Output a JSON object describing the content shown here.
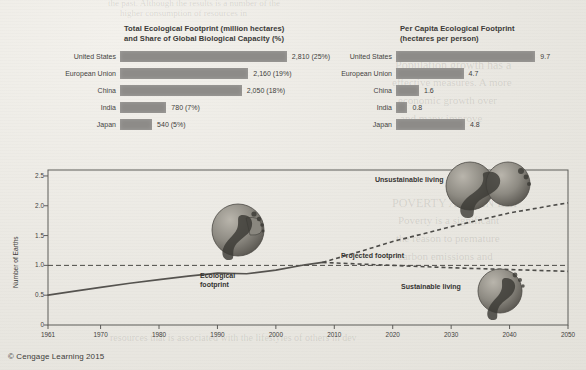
{
  "copyright": "© Cengage Learning 2015",
  "background_bleed": [
    {
      "text": "the past. Although the results is a number of the",
      "x": 108,
      "y": -2,
      "size": 9
    },
    {
      "text": "higher consumption of resources in",
      "x": 120,
      "y": 8,
      "size": 9
    },
    {
      "text": "Population growth has a",
      "x": 395,
      "y": 58,
      "size": 12
    },
    {
      "text": "effective measures. A more",
      "x": 392,
      "y": 76,
      "size": 11
    },
    {
      "text": "economic growth over",
      "x": 398,
      "y": 94,
      "size": 11
    },
    {
      "text": "and many improve",
      "x": 400,
      "y": 112,
      "size": 11
    },
    {
      "text": "POVERTY AND AN EXP",
      "x": 392,
      "y": 196,
      "size": 12
    },
    {
      "text": "Poverty is a significant",
      "x": 398,
      "y": 214,
      "size": 11
    },
    {
      "text": "the reason to premature",
      "x": 396,
      "y": 232,
      "size": 11
    },
    {
      "text": "carbon emissions and",
      "x": 398,
      "y": 250,
      "size": 11
    },
    {
      "text": "resources that is associated with the lifestyles of others in dev",
      "x": 110,
      "y": 332,
      "size": 10
    }
  ],
  "left_chart": {
    "title_line1": "Total Ecological Footprint (million hectares)",
    "title_line2": "and Share of Global Biological Capacity (%)",
    "chart_data": {
      "type": "bar",
      "title": "Total Ecological Footprint (million hectares) and Share of Global Biological Capacity (%)",
      "xlabel": "",
      "ylabel": "",
      "orientation": "horizontal",
      "categories": [
        "United States",
        "European Union",
        "China",
        "India",
        "Japan"
      ],
      "values": [
        2810,
        2160,
        2050,
        780,
        540
      ],
      "shares_percent": [
        25,
        19,
        18,
        7,
        5
      ],
      "value_labels": [
        "2,810 (25%)",
        "2,160 (19%)",
        "2,050 (18%)",
        "780 (7%)",
        "540 (5%)"
      ],
      "xlim": [
        0,
        3200
      ],
      "grid": false,
      "legend": false,
      "bar_color": "#8d8b88"
    }
  },
  "right_chart": {
    "title_line1": "Per Capita Ecological Footprint",
    "title_line2": "(hectares per person)",
    "chart_data": {
      "type": "bar",
      "title": "Per Capita Ecological Footprint (hectares per person)",
      "xlabel": "",
      "ylabel": "",
      "orientation": "horizontal",
      "categories": [
        "United States",
        "European Union",
        "China",
        "India",
        "Japan"
      ],
      "values": [
        9.7,
        4.7,
        1.6,
        0.8,
        4.8
      ],
      "value_labels": [
        "9.7",
        "4.7",
        "1.6",
        "0.8",
        "4.8"
      ],
      "xlim": [
        0,
        11
      ],
      "grid": false,
      "legend": false,
      "bar_color": "#8d8b88"
    }
  },
  "line_chart": {
    "ylabel": "Number of Earths",
    "y_ticks": [
      "0",
      "0.5",
      "1.0",
      "1.5",
      "2.0",
      "2.5"
    ],
    "x_ticks": [
      "1961",
      "1970",
      "1980",
      "1990",
      "2000",
      "2010",
      "2020",
      "2030",
      "2040",
      "2050"
    ],
    "annotations": {
      "ecological_footprint_line1": "Ecological",
      "ecological_footprint_line2": "footprint",
      "projected_footprint": "Projected footprint",
      "unsustainable_living": "Unsustainable living",
      "sustainable_living": "Sustainable living"
    },
    "chart_data": {
      "type": "line",
      "title": "",
      "xlabel": "",
      "ylabel": "Number of Earths",
      "xlim": [
        1961,
        2050
      ],
      "ylim": [
        0,
        2.6
      ],
      "grid": false,
      "legend": false,
      "reference_line": {
        "y": 1.0,
        "style": "dashed",
        "label": "one Earth"
      },
      "series": [
        {
          "name": "Ecological footprint",
          "style": "solid",
          "x": [
            1961,
            1965,
            1970,
            1975,
            1980,
            1985,
            1990,
            1995,
            2000,
            2005,
            2008
          ],
          "values": [
            0.5,
            0.56,
            0.63,
            0.7,
            0.76,
            0.82,
            0.87,
            0.86,
            0.92,
            1.01,
            1.05
          ]
        },
        {
          "name": "Projected footprint - unsustainable living",
          "style": "dashed",
          "x": [
            2008,
            2015,
            2020,
            2030,
            2040,
            2050
          ],
          "values": [
            1.05,
            1.25,
            1.4,
            1.65,
            1.88,
            2.05
          ]
        },
        {
          "name": "Projected footprint - sustainable living",
          "style": "dashed",
          "x": [
            2008,
            2015,
            2020,
            2030,
            2040,
            2050
          ],
          "values": [
            1.05,
            1.02,
            1.0,
            0.96,
            0.93,
            0.9
          ]
        }
      ]
    }
  }
}
